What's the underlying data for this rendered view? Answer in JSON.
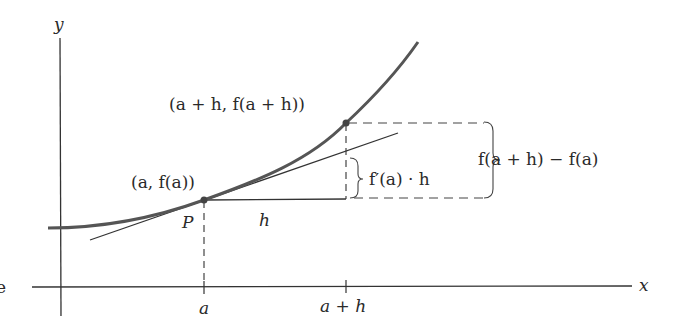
{
  "diagram": {
    "axes": {
      "x_label": "x",
      "y_label": "y"
    },
    "ticks": {
      "a": "a",
      "a_plus_h": "a + h"
    },
    "points": {
      "p_label": "P",
      "p_coords": "(a, f(a))",
      "q_coords": "(a + h, f(a + h))"
    },
    "segments": {
      "h_label": "h",
      "tangent_rise_label": "f′(a) · h",
      "actual_rise_label": "f(a + h) − f(a)"
    },
    "margin_fragment": "e",
    "colors": {
      "curve": "#555555",
      "lines": "#333333",
      "text": "#2a2a2a"
    }
  }
}
